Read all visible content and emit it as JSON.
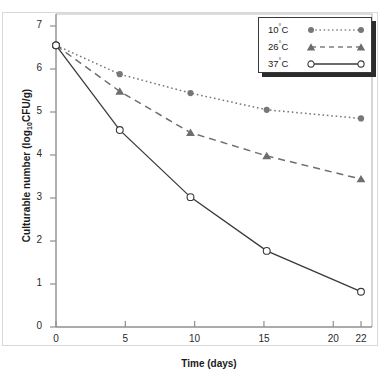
{
  "chart_data": {
    "type": "line",
    "title": "",
    "xlabel": "Time (days)",
    "ylabel_parts": {
      "before": "Culturable number (log",
      "sub": "10",
      "after": "CFU/g)"
    },
    "ylabel": "Culturable number (log10CFU/g)",
    "xlim": [
      0,
      22
    ],
    "ylim": [
      0,
      7
    ],
    "xticks": [
      0,
      5,
      10,
      15,
      20,
      22
    ],
    "xtick_labels": [
      "0",
      "5",
      "10",
      "15",
      "20",
      "22"
    ],
    "yticks": [
      0,
      1,
      2,
      3,
      4,
      5,
      6,
      7
    ],
    "ytick_labels": [
      "0",
      "1",
      "2",
      "3",
      "4",
      "5",
      "6",
      "7"
    ],
    "grid": false,
    "legend_position": "top-right",
    "x": [
      0,
      4.6,
      9.7,
      15.2,
      22
    ],
    "series": [
      {
        "name": "10°C",
        "label_number": "10",
        "label_unit": "C",
        "values": [
          6.55,
          5.88,
          5.44,
          5.05,
          4.85
        ],
        "marker": "filled-circle",
        "line_style": "dotted",
        "color": "#777777"
      },
      {
        "name": "26°C",
        "label_number": "26",
        "label_unit": "C",
        "values": [
          6.55,
          5.48,
          4.52,
          3.98,
          3.44
        ],
        "marker": "filled-triangle",
        "line_style": "dashed",
        "color": "#6e6e6e"
      },
      {
        "name": "37°C",
        "label_number": "37",
        "label_unit": "C",
        "values": [
          6.55,
          4.58,
          3.02,
          1.77,
          0.82
        ],
        "marker": "open-circle",
        "line_style": "solid",
        "color": "#3a3a3a"
      }
    ]
  }
}
